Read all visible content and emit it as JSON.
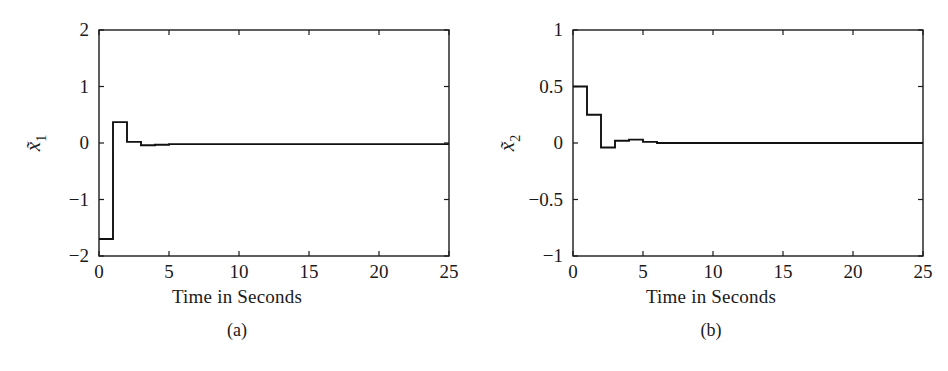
{
  "figure": {
    "panels": [
      {
        "id": "panel-a",
        "subcaption": "(a)",
        "xlabel": "Time in Seconds",
        "ylabel": "x̃₁",
        "ylabel_base": "x",
        "ylabel_sub": "1"
      },
      {
        "id": "panel-b",
        "subcaption": "(b)",
        "xlabel": "Time in Seconds",
        "ylabel": "x̃₂",
        "ylabel_base": "x",
        "ylabel_sub": "2"
      }
    ]
  },
  "chart_data": [
    {
      "type": "line",
      "title": "",
      "subcaption": "(a)",
      "xlabel": "Time in Seconds",
      "ylabel": "x̃₁",
      "xlim": [
        0,
        25
      ],
      "ylim": [
        -2,
        2
      ],
      "xticks": [
        0,
        5,
        10,
        15,
        20,
        25
      ],
      "xtick_labels": [
        "0",
        "5",
        "10",
        "15",
        "20",
        "25"
      ],
      "yticks": [
        -2,
        -1,
        0,
        1,
        2
      ],
      "ytick_labels": [
        "−2",
        "−1",
        "0",
        "1",
        "2"
      ],
      "grid": false,
      "legend": null,
      "line_color": "#111111",
      "series": [
        {
          "name": "x1_tilde",
          "style": "step-post",
          "x": [
            0,
            1,
            1,
            2,
            2,
            3,
            3,
            4,
            4,
            5,
            5,
            6,
            6,
            25
          ],
          "values": [
            -1.7,
            -1.7,
            0.37,
            0.37,
            0.02,
            0.02,
            -0.04,
            -0.04,
            -0.03,
            -0.03,
            -0.02,
            -0.02,
            -0.02,
            -0.02
          ]
        }
      ]
    },
    {
      "type": "line",
      "title": "",
      "subcaption": "(b)",
      "xlabel": "Time in Seconds",
      "ylabel": "x̃₂",
      "xlim": [
        0,
        25
      ],
      "ylim": [
        -1,
        1
      ],
      "xticks": [
        0,
        5,
        10,
        15,
        20,
        25
      ],
      "xtick_labels": [
        "0",
        "5",
        "10",
        "15",
        "20",
        "25"
      ],
      "yticks": [
        -1,
        -0.5,
        0,
        0.5,
        1
      ],
      "ytick_labels": [
        "−1",
        "−0.5",
        "0",
        "0.5",
        "1"
      ],
      "grid": false,
      "legend": null,
      "line_color": "#111111",
      "series": [
        {
          "name": "x2_tilde",
          "style": "step-post",
          "x": [
            0,
            1,
            1,
            2,
            2,
            3,
            3,
            4,
            4,
            5,
            5,
            6,
            6,
            25
          ],
          "values": [
            0.5,
            0.5,
            0.25,
            0.25,
            -0.04,
            -0.04,
            0.02,
            0.02,
            0.03,
            0.03,
            0.01,
            0.01,
            0.0,
            0.0
          ]
        }
      ]
    }
  ]
}
